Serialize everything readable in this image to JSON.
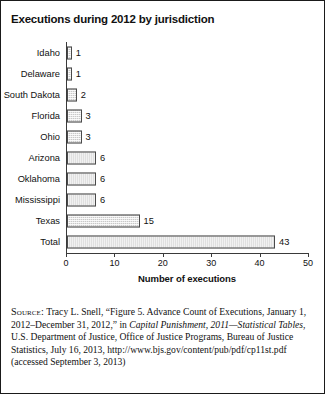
{
  "figure": {
    "title": "Executions during 2012 by jurisdiction"
  },
  "chart_data": {
    "type": "bar",
    "orientation": "horizontal",
    "title": "Executions during 2012 by jurisdiction",
    "xlabel": "Number of executions",
    "ylabel": "",
    "xlim": [
      0,
      50
    ],
    "xticks": [
      0,
      10,
      20,
      30,
      40,
      50
    ],
    "grid": false,
    "legend": null,
    "categories": [
      "Idaho",
      "Delaware",
      "South Dakota",
      "Florida",
      "Ohio",
      "Arizona",
      "Oklahoma",
      "Mississippi",
      "Texas",
      "Total"
    ],
    "values": [
      1,
      1,
      2,
      3,
      3,
      6,
      6,
      6,
      15,
      43
    ],
    "value_labels": [
      "1",
      "1",
      "2",
      "3",
      "3",
      "6",
      "6",
      "6",
      "15",
      "43"
    ],
    "bar_fill_color": "#c9c9c9",
    "bar_border_color": "#4a4a4a",
    "axis_color": "#3a3a3a"
  },
  "source": {
    "label": "Source:",
    "text_part1": " Tracy L. Snell, “Figure 5. Advance Count of Executions, January 1, 2012–December 31, 2012,” in ",
    "italic_title": "Capital Punishment, 2011—Statistical Tables",
    "text_part2": ", U.S. Department of Justice, Office of Justice Programs, Bureau of Justice Statistics, July 16, 2013, http://www.bjs.gov/content/pub/pdf/cp11st.pdf (accessed September 3, 2013)"
  }
}
